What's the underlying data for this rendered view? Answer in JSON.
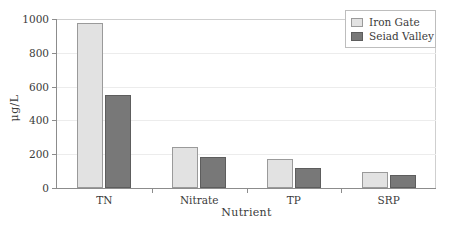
{
  "chart_data": {
    "type": "bar",
    "title": "",
    "xlabel": "Nutrient",
    "ylabel": "μg/L",
    "categories": [
      "TN",
      "Nitrate",
      "TP",
      "SRP"
    ],
    "series": [
      {
        "name": "Iron Gate",
        "color": "#e2e2e2",
        "values": [
          975,
          243,
          172,
          95
        ]
      },
      {
        "name": "Seiad Valley",
        "color": "#787878",
        "values": [
          548,
          183,
          117,
          76
        ]
      }
    ],
    "ylim": [
      0,
      1000
    ],
    "yticks": [
      0,
      200,
      400,
      600,
      800,
      1000
    ],
    "ytick_labels": [
      "0",
      "200",
      "400",
      "600",
      "800",
      "1000"
    ],
    "grid": true,
    "grid_axis": "y",
    "legend_position": "top-right"
  },
  "legend": {
    "entries": [
      {
        "label": "Iron Gate"
      },
      {
        "label": "Seiad Valley"
      }
    ]
  }
}
